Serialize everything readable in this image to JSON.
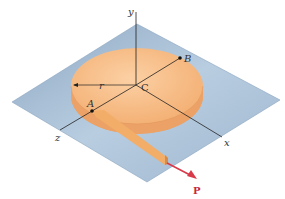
{
  "figure": {
    "labels": {
      "y_axis": "y",
      "x_axis": "x",
      "z_axis": "z",
      "center": "C",
      "point_a": "A",
      "point_b": "B",
      "radius": "r",
      "force": "P"
    },
    "colors": {
      "plane": "#a9bfd6",
      "plane_edge": "#8aa4bf",
      "disc_top": "#f5b77f",
      "disc_side": "#eea56a",
      "strip": "#f0a862",
      "axis": "#222222",
      "force_arrow": "#d83a4a"
    }
  }
}
